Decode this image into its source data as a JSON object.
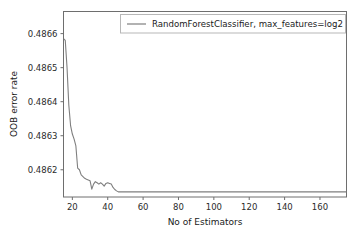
{
  "chart_data": {
    "type": "line",
    "title": "",
    "xlabel": "No of Estimators",
    "ylabel": "OOB error rate",
    "xlim": [
      15,
      175
    ],
    "ylim": [
      0.48612,
      0.486665
    ],
    "grid": false,
    "legend_position": "upper center",
    "xticks": [
      20,
      40,
      60,
      80,
      100,
      120,
      140,
      160
    ],
    "xtick_labels": [
      "20",
      "40",
      "60",
      "80",
      "100",
      "120",
      "140",
      "160"
    ],
    "yticks": [
      0.4862,
      0.4863,
      0.4864,
      0.4865,
      0.4866
    ],
    "ytick_labels": [
      "0.4862",
      "0.4863",
      "0.4864",
      "0.4865",
      "0.4866"
    ],
    "series": [
      {
        "name": "RandomForestClassifier, max_features=log2",
        "color": "#7f7f7f",
        "x": [
          15,
          16,
          17,
          18,
          19,
          20,
          21,
          22,
          23,
          24,
          25,
          26,
          27,
          28,
          29,
          30,
          31,
          32,
          33,
          34,
          35,
          36,
          37,
          38,
          39,
          40,
          41,
          42,
          43,
          44,
          45,
          46,
          47,
          48,
          50,
          55,
          60,
          70,
          80,
          90,
          100,
          110,
          120,
          130,
          140,
          150,
          160,
          170,
          175
        ],
        "y": [
          0.486585,
          0.48658,
          0.4865,
          0.48639,
          0.48633,
          0.486305,
          0.48629,
          0.48627,
          0.486205,
          0.4862,
          0.486185,
          0.48618,
          0.486175,
          0.486172,
          0.48617,
          0.486168,
          0.486143,
          0.486158,
          0.486165,
          0.486162,
          0.486158,
          0.486162,
          0.486158,
          0.486152,
          0.48616,
          0.486162,
          0.48616,
          0.486158,
          0.486148,
          0.486142,
          0.486138,
          0.486135,
          0.486135,
          0.486135,
          0.486135,
          0.486135,
          0.486135,
          0.486135,
          0.486135,
          0.486135,
          0.486135,
          0.486135,
          0.486135,
          0.486135,
          0.486135,
          0.486135,
          0.486135,
          0.486135,
          0.486135
        ]
      }
    ]
  },
  "legend": {
    "entries": [
      {
        "label": "RandomForestClassifier, max_features=log2"
      }
    ]
  },
  "axes": {
    "x_title": "No of Estimators",
    "y_title": "OOB error rate"
  },
  "colors": {
    "line": "#7f7f7f",
    "axis": "#5a5a5a",
    "text": "#1a1a1a",
    "background": "#ffffff"
  }
}
